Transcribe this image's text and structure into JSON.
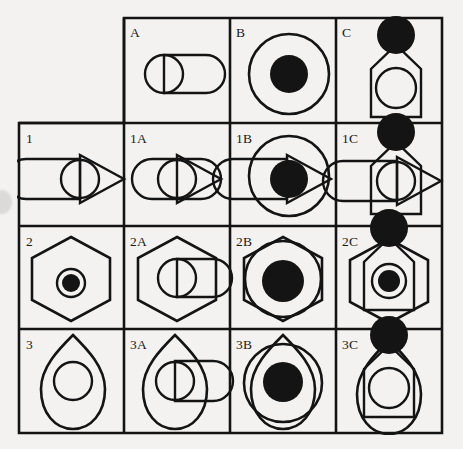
{
  "figure": {
    "type": "combinatorial-shape-matrix",
    "grid": {
      "rows": 4,
      "cols": 4,
      "top_left_cell": "empty"
    },
    "background_color": "#f3f2f0",
    "line_color": "#141414",
    "fill_color": "#141414",
    "column_headers": [
      "A",
      "B",
      "C"
    ],
    "row_headers": [
      "1",
      "2",
      "3"
    ],
    "cells": [
      {
        "id": "r0c0",
        "label": "",
        "row": 0,
        "col": 0,
        "components": [],
        "empty": true
      },
      {
        "id": "A",
        "label": "A",
        "row": 0,
        "col": 1,
        "components": [
          "rounded-rectangle",
          "circle-outline-small"
        ]
      },
      {
        "id": "B",
        "label": "B",
        "row": 0,
        "col": 2,
        "components": [
          "circle-outline-large",
          "circle-filled"
        ]
      },
      {
        "id": "C",
        "label": "C",
        "row": 0,
        "col": 3,
        "components": [
          "house-pentagon",
          "circle-outline-medium",
          "circle-filled-apex"
        ]
      },
      {
        "id": "1",
        "label": "1",
        "row": 1,
        "col": 0,
        "components": [
          "rounded-rectangle-left",
          "triangle-right",
          "circle-outline-small"
        ]
      },
      {
        "id": "1A",
        "label": "1A",
        "row": 1,
        "col": 1,
        "components": [
          "stadium-rectangle",
          "triangle-right",
          "circle-outline-small"
        ]
      },
      {
        "id": "1B",
        "label": "1B",
        "row": 1,
        "col": 2,
        "components": [
          "rounded-rectangle-left",
          "triangle-right",
          "circle-outline-large",
          "circle-filled"
        ]
      },
      {
        "id": "1C",
        "label": "1C",
        "row": 1,
        "col": 3,
        "components": [
          "rounded-rectangle-left",
          "triangle-right",
          "house-pentagon",
          "circle-outline-medium",
          "circle-filled-apex"
        ]
      },
      {
        "id": "2",
        "label": "2",
        "row": 2,
        "col": 0,
        "components": [
          "hexagon",
          "circle-outline-small",
          "circle-filled"
        ]
      },
      {
        "id": "2A",
        "label": "2A",
        "row": 2,
        "col": 1,
        "components": [
          "hexagon",
          "rounded-rectangle",
          "circle-outline-small"
        ]
      },
      {
        "id": "2B",
        "label": "2B",
        "row": 2,
        "col": 2,
        "components": [
          "hexagon",
          "circle-outline-large",
          "circle-filled"
        ]
      },
      {
        "id": "2C",
        "label": "2C",
        "row": 2,
        "col": 3,
        "components": [
          "hexagon",
          "house-pentagon",
          "circle-outline-medium",
          "circle-filled",
          "circle-filled-apex"
        ]
      },
      {
        "id": "3",
        "label": "3",
        "row": 3,
        "col": 0,
        "components": [
          "bullet-shield",
          "circle-outline-medium"
        ]
      },
      {
        "id": "3A",
        "label": "3A",
        "row": 3,
        "col": 1,
        "components": [
          "bullet-shield",
          "rounded-rectangle",
          "circle-outline-small"
        ]
      },
      {
        "id": "3B",
        "label": "3B",
        "row": 3,
        "col": 2,
        "components": [
          "bullet-shield",
          "circle-outline-large",
          "circle-filled"
        ]
      },
      {
        "id": "3C",
        "label": "3C",
        "row": 3,
        "col": 3,
        "components": [
          "bullet-shield",
          "house-pentagon",
          "circle-outline-medium",
          "circle-filled-apex"
        ]
      }
    ]
  }
}
